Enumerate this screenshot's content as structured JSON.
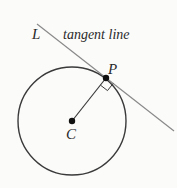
{
  "diagram": {
    "labels": {
      "line": "L",
      "tangent_caption": "tangent line",
      "point_of_tangency": "P",
      "center": "C"
    },
    "colors": {
      "circle": "#3a3a3a",
      "tangent_line": "#8a8a8a",
      "radius": "#3a3a3a",
      "points": "#111111",
      "background": "#fbfbfa"
    },
    "elements": [
      {
        "type": "circle",
        "name": "circle",
        "center": "C",
        "radius": "CP"
      },
      {
        "type": "segment",
        "name": "radius",
        "from": "C",
        "to": "P"
      },
      {
        "type": "line",
        "name": "tangent-line",
        "label": "L",
        "touches": "P"
      },
      {
        "type": "right-angle-marker",
        "at": "P",
        "between": [
          "radius",
          "tangent-line"
        ]
      }
    ]
  }
}
